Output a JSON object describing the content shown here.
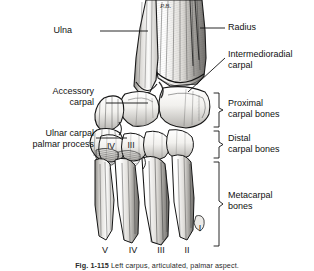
{
  "figure": {
    "title_prefix": "Fig. 1-115",
    "caption": "Fig. 1-115  Left carpus, articulated, palmar aspect.",
    "caption_label": "Fig. 1-115",
    "caption_text": "Left carpus, articulated, palmar aspect.",
    "artist_signature": "P.B.",
    "background_color": "#ffffff",
    "ink_color": "#111111",
    "bone_fill": "#f2f1ef",
    "bone_shade": "#8d8d8d"
  },
  "labels_left": [
    {
      "id": "ulna",
      "text": "Ulna",
      "x": 72,
      "y": 25,
      "leader_x1": 100,
      "leader_y1": 31,
      "leader_x2": 148,
      "leader_y2": 31
    },
    {
      "id": "accessory-carpal",
      "text": "Accessory\ncarpal",
      "x": 39,
      "y": 86,
      "leader_x1": 106,
      "leader_y1": 103,
      "leader_x2": 148,
      "leader_y2": 103
    },
    {
      "id": "ulnar-carpal-palmar-process",
      "text": "Ulnar carpal\npalmar process",
      "x": 17,
      "y": 128,
      "leader_x1": 96,
      "leader_y1": 138,
      "leader_x2": 127,
      "leader_y2": 138
    }
  ],
  "labels_right": [
    {
      "id": "radius",
      "text": "Radius",
      "x": 229,
      "y": 22,
      "leader_x1": 200,
      "leader_y1": 28,
      "leader_x2": 225,
      "leader_y2": 28
    },
    {
      "id": "intermedioradial-carpal",
      "text": "Intermedioradial\ncarpal",
      "x": 229,
      "y": 49,
      "leader_x1": 188,
      "leader_y1": 92,
      "leader_x2": 226,
      "leader_y2": 58
    }
  ],
  "brackets": [
    {
      "id": "proximal-carpal-bones",
      "text": "Proximal\ncarpal bones",
      "top": 93,
      "bottom": 127,
      "x_line": 219,
      "label_x": 229,
      "label_y": 99
    },
    {
      "id": "distal-carpal-bones",
      "text": "Distal\ncarpal bones",
      "top": 131,
      "bottom": 158,
      "x_line": 219,
      "label_x": 229,
      "label_y": 133
    },
    {
      "id": "metacarpal-bones",
      "text": "Metacarpal\nbones",
      "top": 162,
      "bottom": 246,
      "x_line": 219,
      "label_x": 229,
      "label_y": 191
    }
  ],
  "numerals_on_bones": [
    {
      "id": "distal-carpal-iv",
      "text": "IV",
      "x": 111,
      "y": 146
    },
    {
      "id": "distal-carpal-iii",
      "text": "III",
      "x": 130,
      "y": 145
    }
  ],
  "numerals_bottom": [
    {
      "id": "metacarpal-v",
      "text": "V",
      "x": 105,
      "y": 247
    },
    {
      "id": "metacarpal-iv",
      "text": "IV",
      "x": 133,
      "y": 247
    },
    {
      "id": "metacarpal-iii",
      "text": "III",
      "x": 161,
      "y": 247
    },
    {
      "id": "metacarpal-ii",
      "text": "II",
      "x": 187,
      "y": 247
    },
    {
      "id": "metacarpal-i",
      "text": "I",
      "x": 200,
      "y": 226
    }
  ]
}
